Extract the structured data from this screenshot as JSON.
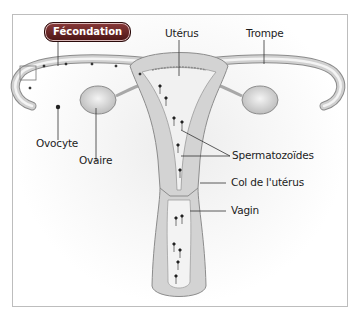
{
  "badge": {
    "label": "Fécondation",
    "color": "#6a2020"
  },
  "labels": {
    "uterus": "Utérus",
    "trompe": "Trompe",
    "ovocyte": "Ovocyte",
    "ovaire": "Ovaire",
    "spermatozoides": "Spermatozoïdes",
    "col": "Col de l'utérus",
    "vagin": "Vagin"
  },
  "colors": {
    "tissue": "#c9c9c9",
    "tissue_dark": "#a8a8a8",
    "lumen": "#f2f2f2",
    "outline": "#8c8c8c",
    "leader_line": "#333333"
  }
}
